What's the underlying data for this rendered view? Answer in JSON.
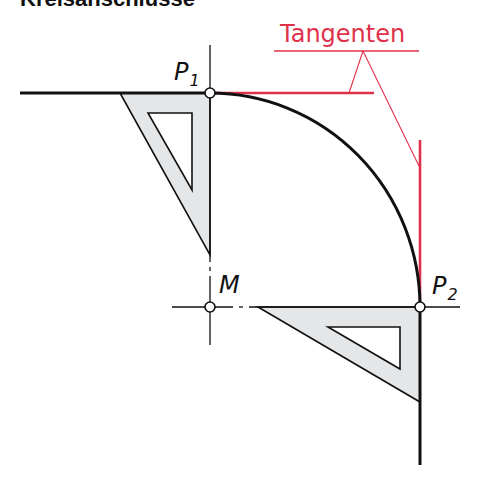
{
  "title": "Kreisanschlüsse",
  "labels": {
    "p1": "P",
    "p1_sub": "1",
    "p2": "P",
    "p2_sub": "2",
    "center": "M",
    "tangents": "Tangenten"
  },
  "colors": {
    "line": "#111111",
    "tangent": "#e0314b",
    "triangle_fill": "#e4e6e8",
    "background": "#ffffff"
  }
}
